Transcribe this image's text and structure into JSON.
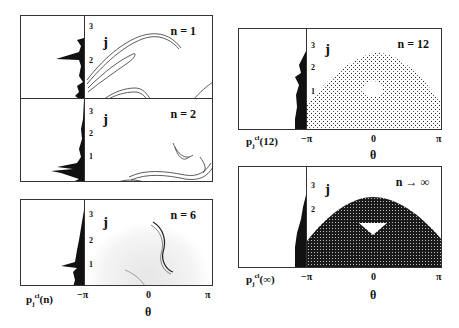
{
  "figure": {
    "left_column": {
      "panels": [
        {
          "n_label": "n = 1",
          "y_axis": "j",
          "ticks": [
            "3",
            "2",
            "1"
          ]
        },
        {
          "n_label": "n = 2",
          "y_axis": "j",
          "ticks": [
            "3",
            "2",
            "1"
          ]
        },
        {
          "n_label": "n = 6",
          "y_axis": "j",
          "ticks": [
            "3",
            "2",
            "1"
          ]
        }
      ],
      "hist_label": "p",
      "hist_sub": "j",
      "hist_sup": "cl",
      "hist_arg": "(n)",
      "x_ticks": [
        "−π",
        "0",
        "π"
      ],
      "x_label": "θ"
    },
    "right_column": {
      "panels": [
        {
          "n_label": "n = 12",
          "y_axis": "j",
          "ticks": [
            "3",
            "2",
            "1"
          ],
          "hist_arg": "(12)"
        },
        {
          "n_label": "n → ∞",
          "y_axis": "j",
          "ticks": [
            "3",
            "2"
          ],
          "hist_arg": "(∞)"
        }
      ],
      "hist_label": "p",
      "hist_sub": "j",
      "hist_sup": "cl",
      "x_ticks": [
        "−π",
        "0",
        "π"
      ],
      "x_label": "θ"
    }
  }
}
